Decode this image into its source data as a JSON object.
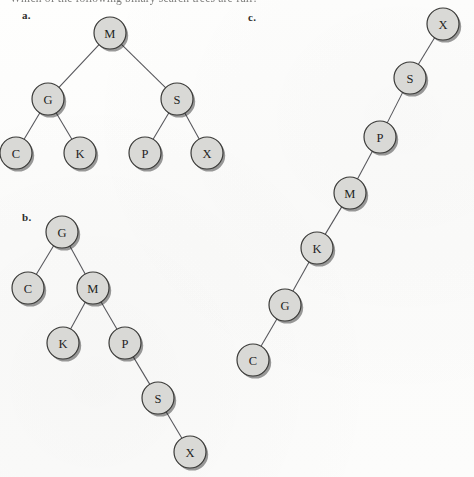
{
  "page": {
    "background_color": "#fdfdfc",
    "question_text": "Which of the following binary search trees are full?",
    "node_fill_color": "#d9d9d6",
    "node_stroke_color": "#3a3a38",
    "edge_color": "#55555a",
    "label_color": "#1f1f1e"
  },
  "trees": [
    {
      "id": "a",
      "label": "a.",
      "label_x": 22,
      "label_y": 20,
      "node_radius": 16,
      "nodes": [
        {
          "id": "a-M",
          "label": "M",
          "x": 110,
          "y": 33
        },
        {
          "id": "a-G",
          "label": "G",
          "x": 48,
          "y": 99
        },
        {
          "id": "a-S",
          "label": "S",
          "x": 177,
          "y": 99
        },
        {
          "id": "a-C",
          "label": "C",
          "x": 16,
          "y": 153
        },
        {
          "id": "a-K",
          "label": "K",
          "x": 80,
          "y": 153
        },
        {
          "id": "a-P",
          "label": "P",
          "x": 145,
          "y": 153
        },
        {
          "id": "a-X",
          "label": "X",
          "x": 207,
          "y": 153
        }
      ],
      "edges": [
        {
          "from": "a-M",
          "to": "a-G"
        },
        {
          "from": "a-M",
          "to": "a-S"
        },
        {
          "from": "a-G",
          "to": "a-C"
        },
        {
          "from": "a-G",
          "to": "a-K"
        },
        {
          "from": "a-S",
          "to": "a-P"
        },
        {
          "from": "a-S",
          "to": "a-X"
        }
      ]
    },
    {
      "id": "b",
      "label": "b.",
      "label_x": 22,
      "label_y": 222,
      "node_radius": 16,
      "nodes": [
        {
          "id": "b-G",
          "label": "G",
          "x": 62,
          "y": 232
        },
        {
          "id": "b-C",
          "label": "C",
          "x": 28,
          "y": 288
        },
        {
          "id": "b-M",
          "label": "M",
          "x": 93,
          "y": 288
        },
        {
          "id": "b-K",
          "label": "K",
          "x": 63,
          "y": 343
        },
        {
          "id": "b-P",
          "label": "P",
          "x": 125,
          "y": 343
        },
        {
          "id": "b-S",
          "label": "S",
          "x": 158,
          "y": 398
        },
        {
          "id": "b-X",
          "label": "X",
          "x": 190,
          "y": 452
        }
      ],
      "edges": [
        {
          "from": "b-G",
          "to": "b-C"
        },
        {
          "from": "b-G",
          "to": "b-M"
        },
        {
          "from": "b-M",
          "to": "b-K"
        },
        {
          "from": "b-M",
          "to": "b-P"
        },
        {
          "from": "b-P",
          "to": "b-S"
        },
        {
          "from": "b-S",
          "to": "b-X"
        }
      ]
    },
    {
      "id": "c",
      "label": "c.",
      "label_x": 248,
      "label_y": 22,
      "node_radius": 16,
      "nodes": [
        {
          "id": "c-X",
          "label": "X",
          "x": 443,
          "y": 24
        },
        {
          "id": "c-S",
          "label": "S",
          "x": 410,
          "y": 78
        },
        {
          "id": "c-P",
          "label": "P",
          "x": 380,
          "y": 137
        },
        {
          "id": "c-M",
          "label": "M",
          "x": 350,
          "y": 193
        },
        {
          "id": "c-K",
          "label": "K",
          "x": 317,
          "y": 248
        },
        {
          "id": "c-G",
          "label": "G",
          "x": 285,
          "y": 305
        },
        {
          "id": "c-C",
          "label": "C",
          "x": 253,
          "y": 360
        }
      ],
      "edges": [
        {
          "from": "c-X",
          "to": "c-S"
        },
        {
          "from": "c-S",
          "to": "c-P"
        },
        {
          "from": "c-P",
          "to": "c-M"
        },
        {
          "from": "c-M",
          "to": "c-K"
        },
        {
          "from": "c-K",
          "to": "c-G"
        },
        {
          "from": "c-G",
          "to": "c-C"
        }
      ]
    }
  ]
}
